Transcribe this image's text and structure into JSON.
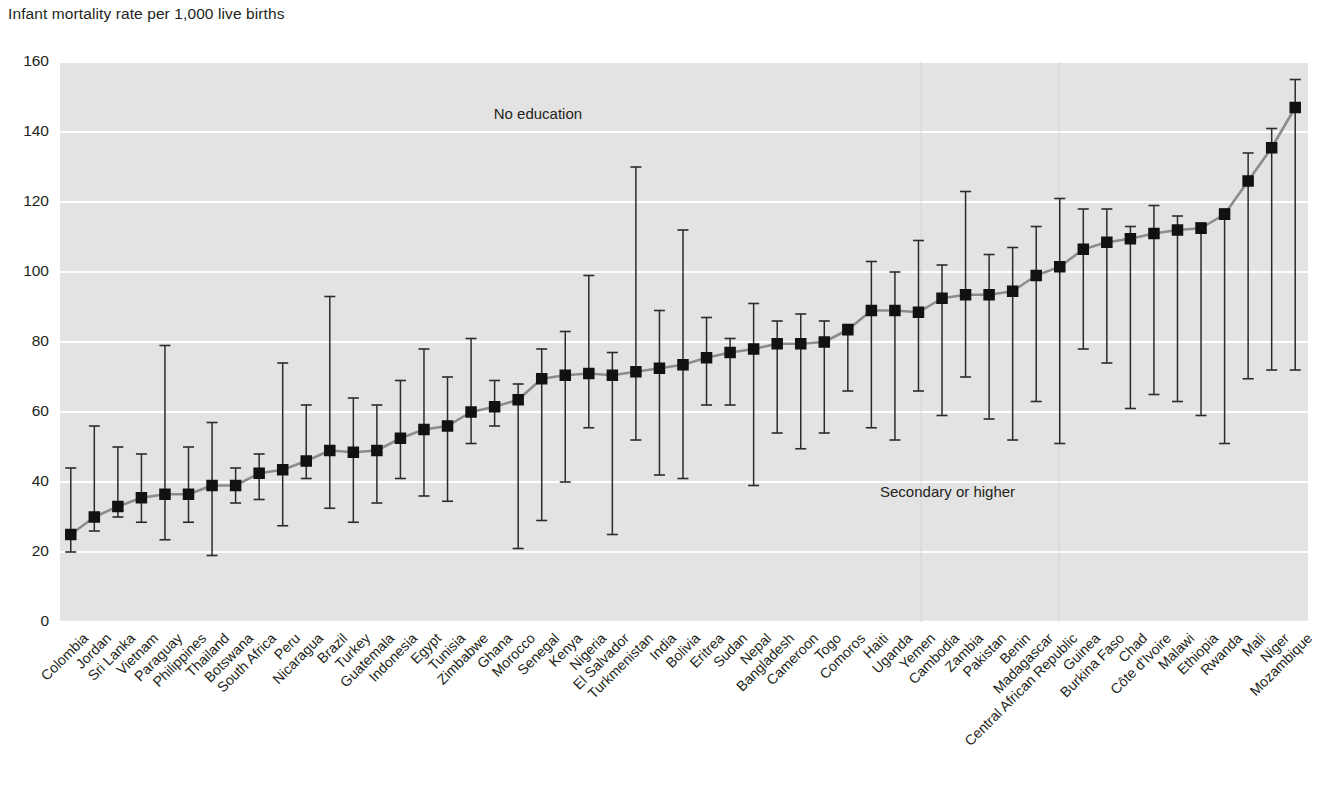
{
  "chart_data": {
    "type": "scatter",
    "title": "",
    "ylabel": "Infant mortality rate per 1,000 live births",
    "xlabel": "",
    "ylim": [
      0,
      160
    ],
    "ytick_step": 20,
    "yticks": [
      "0",
      "20",
      "40",
      "60",
      "80",
      "100",
      "120",
      "140",
      "160"
    ],
    "grid": true,
    "grid_color": "#ffffff",
    "plot_bg": "#e3e3e3",
    "marker_color": "#111111",
    "line_color": "#8c8c8c",
    "annotations": [
      {
        "text": "No education",
        "x_category": "Senegal",
        "y": 145
      },
      {
        "text": "Secondary or higher",
        "x_category": "Cambodia",
        "y": 37
      }
    ],
    "series_description": "Square marker = overall infant mortality rate; whisker top = rate for mothers with no education; whisker bottom = rate for mothers with secondary or higher education.",
    "categories": [
      "Colombia",
      "Jordan",
      "Sri Lanka",
      "Vietnam",
      "Paraguay",
      "Philippines",
      "Thailand",
      "Botswana",
      "South Africa",
      "Peru",
      "Nicaragua",
      "Brazil",
      "Turkey",
      "Guatemala",
      "Indonesia",
      "Egypt",
      "Tunisia",
      "Zimbabwe",
      "Ghana",
      "Morocco",
      "Senegal",
      "Kenya",
      "Nigeria",
      "El Salvador",
      "Turkmenistan",
      "India",
      "Bolivia",
      "Eritrea",
      "Sudan",
      "Nepal",
      "Bangladesh",
      "Cameroon",
      "Togo",
      "Comoros",
      "Haiti",
      "Uganda",
      "Yemen",
      "Cambodia",
      "Zambia",
      "Pakistan",
      "Benin",
      "Madagascar",
      "Central African Republic",
      "Guinea",
      "Burkina Faso",
      "Chad",
      "Côte d'Ivoire",
      "Malawi",
      "Ethiopia",
      "Rwanda",
      "Mali",
      "Niger",
      "Mozambique"
    ],
    "values": [
      25,
      30,
      33,
      35.5,
      36.5,
      36.5,
      39,
      39,
      42.5,
      43.5,
      46,
      49,
      48.5,
      49,
      52.5,
      55,
      56,
      60,
      61.5,
      63.5,
      69.5,
      70.5,
      71,
      70.5,
      71.5,
      72.5,
      73.5,
      75.5,
      77,
      78,
      79.5,
      79.5,
      80,
      83.5,
      89,
      89,
      88.5,
      92.5,
      93.5,
      93.5,
      94.5,
      99,
      101.5,
      106.5,
      108.5,
      109.5,
      111,
      112,
      112.5,
      116.5,
      126,
      135.5,
      147
    ],
    "upper_no_education": [
      44,
      56,
      50,
      48,
      79,
      50,
      57,
      44,
      48,
      74,
      62,
      93,
      64,
      62,
      69,
      78,
      70,
      81,
      69,
      68,
      78,
      83,
      99,
      77,
      130,
      89,
      112,
      87,
      81,
      91,
      86,
      88,
      86,
      85,
      103,
      100,
      109,
      102,
      123,
      105,
      107,
      113,
      121,
      118,
      118,
      113,
      119,
      116,
      114,
      118,
      134,
      141,
      155
    ],
    "lower_secondary_or_higher": [
      20,
      26,
      30,
      28.5,
      23.5,
      28.5,
      19,
      34,
      35,
      27.5,
      41,
      32.5,
      28.5,
      34,
      41,
      36,
      34.5,
      51,
      56,
      21,
      29,
      40,
      55.5,
      25,
      52,
      42,
      41,
      62,
      62,
      39,
      54,
      49.5,
      54,
      66,
      55.5,
      52,
      66,
      59,
      70,
      58,
      52,
      63,
      51,
      78,
      74,
      61,
      65,
      63,
      59,
      51,
      69.5,
      72,
      72
    ]
  },
  "labels": {
    "y_axis_caption": "Infant mortality rate per 1,000 live births",
    "no_education": "No education",
    "secondary_or_higher": "Secondary or higher"
  }
}
